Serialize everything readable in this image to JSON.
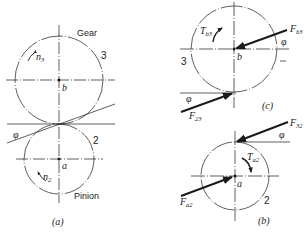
{
  "figure": {
    "panel_a": {
      "caption": "(a)",
      "gear_label": "Gear",
      "gear_number": "3",
      "gear_center_label": "b",
      "gear_speed_symbol": "n",
      "gear_speed_sub": "3",
      "pinion_label": "Pinion",
      "pinion_number": "2",
      "pinion_center_label": "a",
      "pinion_speed_symbol": "n",
      "pinion_speed_sub": "2",
      "pressure_angle": "φ"
    },
    "panel_c": {
      "caption": "(c)",
      "gear_number": "3",
      "center_label": "b",
      "torque_symbol": "T",
      "torque_sub": "b3",
      "force_b_symbol": "F",
      "force_b_sub": "b3",
      "force_23_symbol": "F",
      "force_23_sub": "23",
      "angle_top": "φ",
      "angle_bottom": "φ"
    },
    "panel_b": {
      "caption": "(b)",
      "pinion_number": "2",
      "center_label": "a",
      "torque_symbol": "T",
      "torque_sub": "a2",
      "force_32_symbol": "F",
      "force_32_sub": "32",
      "force_a_symbol": "F",
      "force_a_sub": "a2",
      "angle": "φ"
    },
    "colors": {
      "line": "#1a1a1a",
      "background": "#ffffff"
    }
  }
}
